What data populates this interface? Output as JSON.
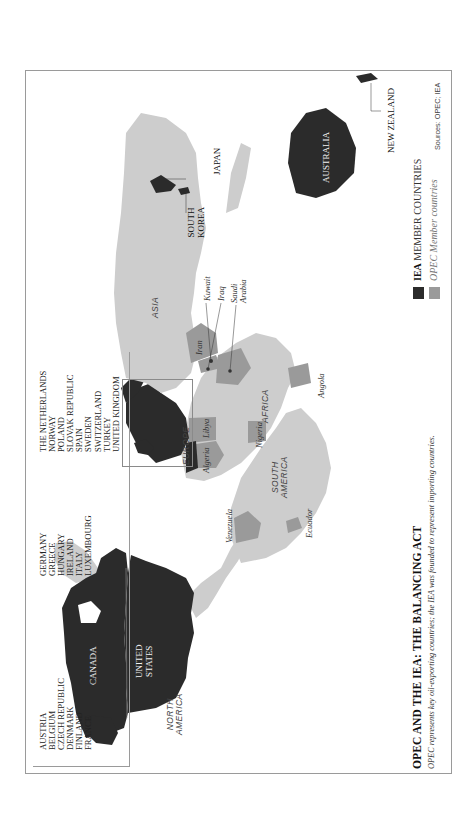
{
  "figure": {
    "title": "OPEC AND THE IEA: THE BALANCING ACT",
    "subtitle": "OPEC represents key oil-exporting countries; the IEA was founded to represent importing countries.",
    "sources": "Sources: OPEC; IEA",
    "orientation": "rotated 90° counter-clockwise"
  },
  "colors": {
    "iea_member": "#2b2b2b",
    "opec_member": "#9a9a9a",
    "other_land": "#cdcdcd",
    "ocean": "#ffffff",
    "frame": "#9a9a9a"
  },
  "legend": {
    "iea": {
      "bold": "IEA",
      "rest": "MEMBER COUNTRIES"
    },
    "opec": {
      "label": "OPEC Member countries"
    }
  },
  "iea_country_list": {
    "columns": [
      [
        "AUSTRIA",
        "BELGIUM",
        "CZECH REPUBLIC",
        "DENMARK",
        "FINLAND",
        "FRANCE"
      ],
      [
        "GERMANY",
        "GREECE",
        "HUNGARY",
        "IRELAND",
        "ITALY",
        "LUXEMBOURG"
      ],
      [
        "THE NETHERLANDS",
        "NORWAY",
        "POLAND",
        "SLOVAK REPUBLIC",
        "SPAIN",
        "SWEDEN",
        "SWITZERLAND",
        "TURKEY",
        "UNITED KINGDOM"
      ]
    ]
  },
  "map_labels": {
    "continents": {
      "north_america": [
        "NORTH",
        "AMERICA"
      ],
      "south_america": [
        "SOUTH",
        "AMERICA"
      ],
      "europe": "EUROPE",
      "africa": "AFRICA",
      "asia": "ASIA"
    },
    "iea_countries": {
      "canada": "CANADA",
      "united_states": [
        "UNITED",
        "STATES"
      ],
      "australia": "AUSTRALIA",
      "japan": "JAPAN",
      "south_korea": [
        "SOUTH",
        "KOREA"
      ],
      "new_zealand": "NEW ZEALAND"
    },
    "opec_countries": {
      "venezuela": "Venezuela",
      "ecuador": "Ecuador",
      "algeria": "Algeria",
      "libya": "Libya",
      "nigeria": "Nigeria",
      "angola": "Angola",
      "iran": "Iran",
      "iraq": "Iraq",
      "kuwait": "Kuwait",
      "saudi_arabia": [
        "Saudi",
        "Arabia"
      ]
    }
  }
}
